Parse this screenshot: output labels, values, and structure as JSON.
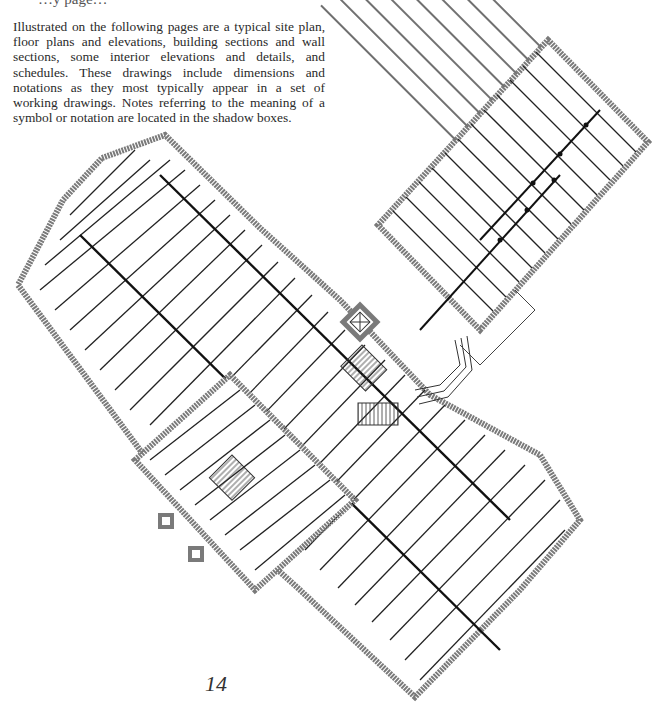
{
  "page": {
    "cutoff_heading": "…y page…",
    "intro_paragraph": "Illustrated on the following pages are a typical site plan, floor plans and elevations, building sections and wall sections, some interior elevations and details, and schedules. These drawings include dimensions and notations as they most typically appear in a set of working drawings. Notes referring to the meaning of a symbol or notation are located in the shadow boxes.",
    "page_number": "14"
  },
  "drawing": {
    "type": "framing floor plan",
    "description": "Cross-shaped building framing plan rotated 45°, showing joists, beams, stairs, elevator shaft and bay window",
    "colors": {
      "wall": "#7a7a7a",
      "joist": "#222222",
      "beam": "#111111"
    }
  }
}
